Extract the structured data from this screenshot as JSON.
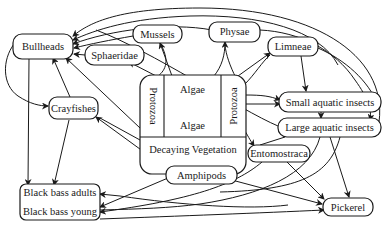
{
  "diagram": {
    "colors": {
      "ink": "#1a1a1a",
      "background": "#ffffff"
    },
    "nodes": {
      "bullheads": {
        "label": "Bullheads"
      },
      "mussels": {
        "label": "Mussels"
      },
      "physae": {
        "label": "Physae"
      },
      "sphaeridae": {
        "label": "Sphaeridae"
      },
      "limneae": {
        "label": "Limneae"
      },
      "crayfishes": {
        "label": "Crayfishes"
      },
      "algae_top": {
        "label": "Algae"
      },
      "algae_bottom": {
        "label": "Algae"
      },
      "protozoa_left": {
        "label": "Protozoa"
      },
      "protozoa_right": {
        "label": "Protozoa"
      },
      "decaying_vegetation": {
        "label": "Decaying Vegetation"
      },
      "small_aquatic_insects": {
        "label": "Small aquatic insects"
      },
      "large_aquatic_insects": {
        "label": "Large aquatic insects"
      },
      "entomostraca": {
        "label": "Entomostraca"
      },
      "amphipods": {
        "label": "Amphipods"
      },
      "black_bass_adults": {
        "label": "Black bass adults"
      },
      "black_bass_young": {
        "label": "Black bass young"
      },
      "pickerel": {
        "label": "Pickerel"
      }
    },
    "edges": [
      {
        "from": "Mussels",
        "to": "Bullheads"
      },
      {
        "from": "Physae",
        "to": "Bullheads"
      },
      {
        "from": "Limneae",
        "to": "Bullheads"
      },
      {
        "from": "Large aquatic insects",
        "to": "Bullheads"
      },
      {
        "from": "Sphaeridae",
        "to": "Bullheads"
      },
      {
        "from": "Crayfishes",
        "to": "Bullheads"
      },
      {
        "from": "Algae",
        "to": "Bullheads"
      },
      {
        "from": "Bullheads",
        "to": "Crayfishes"
      },
      {
        "from": "Algae",
        "to": "Mussels"
      },
      {
        "from": "Algae",
        "to": "Sphaeridae"
      },
      {
        "from": "Algae",
        "to": "Physae"
      },
      {
        "from": "Algae",
        "to": "Limneae"
      },
      {
        "from": "Decaying Vegetation",
        "to": "Crayfishes"
      },
      {
        "from": "Limneae",
        "to": "Small aquatic insects"
      },
      {
        "from": "Protozoa",
        "to": "Small aquatic insects"
      },
      {
        "from": "Algae",
        "to": "Small aquatic insects"
      },
      {
        "from": "Small aquatic insects",
        "to": "Large aquatic insects"
      },
      {
        "from": "Physae",
        "to": "Large aquatic insects"
      },
      {
        "from": "Protozoa",
        "to": "Entomostraca"
      },
      {
        "from": "Decaying Vegetation",
        "to": "Amphipods"
      },
      {
        "from": "Bullheads",
        "to": "Black bass adults"
      },
      {
        "from": "Crayfishes",
        "to": "Black bass adults"
      },
      {
        "from": "Large aquatic insects",
        "to": "Black bass adults"
      },
      {
        "from": "Amphipods",
        "to": "Black bass young"
      },
      {
        "from": "Entomostraca",
        "to": "Black bass young"
      },
      {
        "from": "Large aquatic insects",
        "to": "Black bass young"
      },
      {
        "from": "Amphipods",
        "to": "Pickerel"
      },
      {
        "from": "Entomostraca",
        "to": "Pickerel"
      },
      {
        "from": "Large aquatic insects",
        "to": "Pickerel"
      },
      {
        "from": "Black bass young",
        "to": "Pickerel"
      }
    ]
  }
}
